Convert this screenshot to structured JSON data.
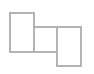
{
  "figure": {
    "width": 94,
    "height": 74,
    "background_color": "#ffffff",
    "stroke_color": "#b4b4b4",
    "stroke_width": 1.5,
    "fill": "none"
  },
  "chart_data": {
    "type": "diagram",
    "title": "",
    "xlabel": "",
    "ylabel": "",
    "grid": false,
    "legend": null,
    "xlim": [
      0,
      94
    ],
    "ylim": [
      0,
      74
    ],
    "shapes": [
      {
        "id": "rect-left",
        "shape": "rectangle",
        "x": 10,
        "y": 13,
        "width": 24,
        "height": 39,
        "stroke": "#b4b4b4",
        "fill": "none",
        "label": ""
      },
      {
        "id": "rect-middle",
        "shape": "rectangle",
        "x": 34,
        "y": 27,
        "width": 23,
        "height": 25,
        "stroke": "#b4b4b4",
        "fill": "none",
        "label": ""
      },
      {
        "id": "rect-right",
        "shape": "rectangle",
        "x": 57,
        "y": 27,
        "width": 24,
        "height": 39,
        "stroke": "#b4b4b4",
        "fill": "none",
        "label": ""
      }
    ]
  }
}
